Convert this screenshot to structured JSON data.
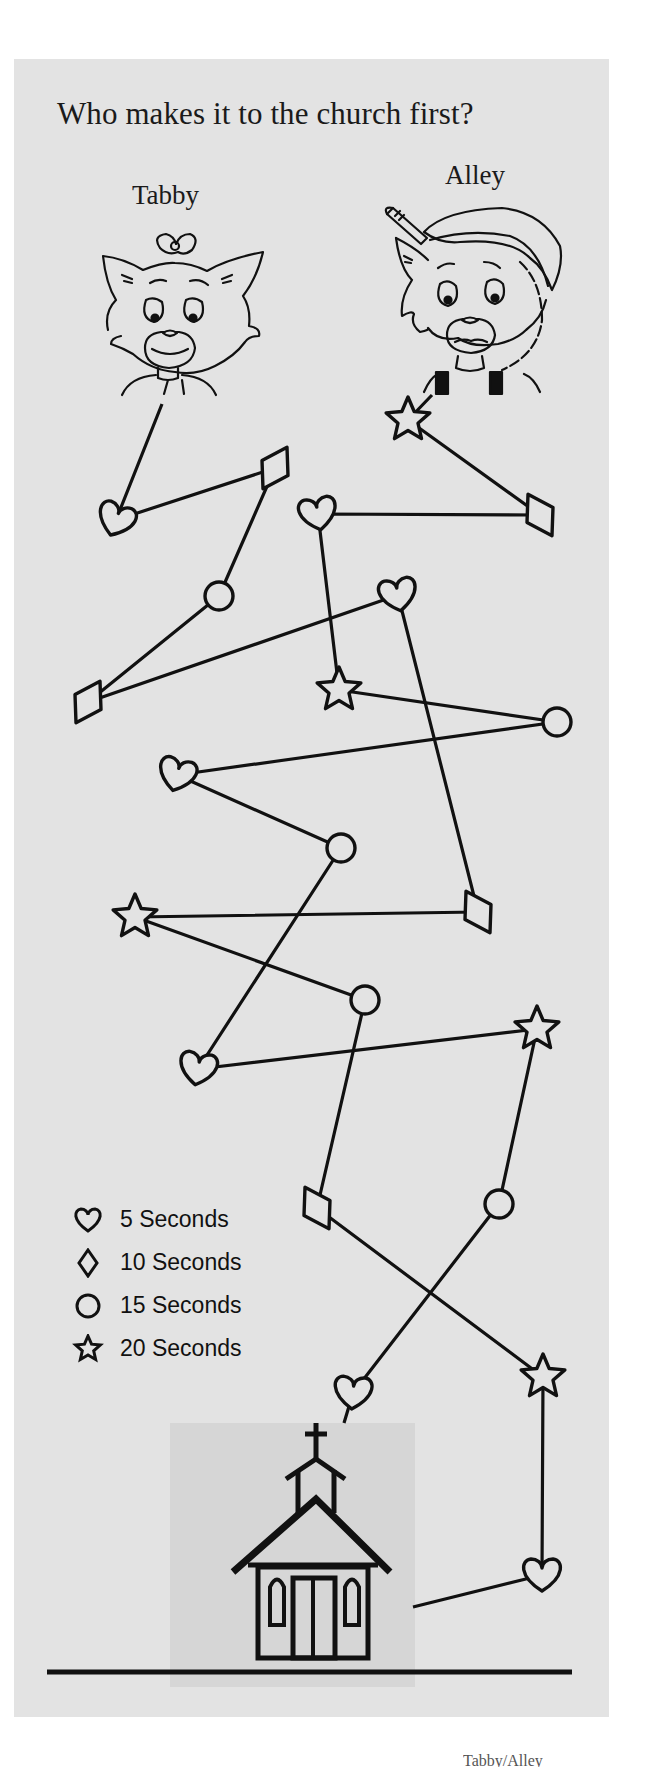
{
  "title": "Who makes it to the church first?",
  "characters": {
    "tabby": {
      "name": "Tabby"
    },
    "alley": {
      "name": "Alley"
    }
  },
  "legend": [
    {
      "shape": "heart",
      "icon": "heart-icon",
      "label": "5 Seconds",
      "seconds": 5
    },
    {
      "shape": "diamond",
      "icon": "diamond-icon",
      "label": "10 Seconds",
      "seconds": 10
    },
    {
      "shape": "circle",
      "icon": "circle-icon",
      "label": "15 Seconds",
      "seconds": 15
    },
    {
      "shape": "star",
      "icon": "star-icon",
      "label": "20 Seconds",
      "seconds": 20
    }
  ],
  "colors": {
    "panel": "#e3e3e3",
    "church_backdrop": "#d6d6d6",
    "ink": "#111111"
  },
  "paths": {
    "tabby": {
      "start": [
        162,
        404
      ],
      "nodes": [
        {
          "shape": "heart",
          "x": 116,
          "y": 520,
          "rot": 20
        },
        {
          "shape": "diamond",
          "x": 275,
          "y": 468,
          "rot": 30
        },
        {
          "shape": "circle",
          "x": 219,
          "y": 596
        },
        {
          "shape": "diamond",
          "x": 88,
          "y": 702,
          "rot": 30
        },
        {
          "shape": "heart",
          "x": 398,
          "y": 595,
          "rot": -10
        },
        {
          "shape": "diamond",
          "x": 478,
          "y": 912,
          "rot": -30
        },
        {
          "shape": "star",
          "x": 135,
          "y": 917
        },
        {
          "shape": "circle",
          "x": 365,
          "y": 1000
        },
        {
          "shape": "diamond",
          "x": 317,
          "y": 1208,
          "rot": -30
        },
        {
          "shape": "star",
          "x": 543,
          "y": 1377
        },
        {
          "shape": "heart",
          "x": 542,
          "y": 1575,
          "rot": 0
        }
      ],
      "end": [
        413,
        1607
      ]
    },
    "alley": {
      "start": [
        432,
        395
      ],
      "nodes": [
        {
          "shape": "star",
          "x": 408,
          "y": 420
        },
        {
          "shape": "diamond",
          "x": 540,
          "y": 515,
          "rot": -30
        },
        {
          "shape": "heart",
          "x": 318,
          "y": 514,
          "rot": -10
        },
        {
          "shape": "star",
          "x": 339,
          "y": 690
        },
        {
          "shape": "circle",
          "x": 557,
          "y": 722
        },
        {
          "shape": "heart",
          "x": 177,
          "y": 775,
          "rot": 15
        },
        {
          "shape": "circle",
          "x": 341,
          "y": 848
        },
        {
          "shape": "heart",
          "x": 198,
          "y": 1069,
          "rot": 10
        },
        {
          "shape": "star",
          "x": 537,
          "y": 1029
        },
        {
          "shape": "circle",
          "x": 499,
          "y": 1204
        },
        {
          "shape": "heart",
          "x": 353,
          "y": 1393,
          "rot": 5
        }
      ],
      "end": [
        344,
        1423
      ]
    }
  },
  "footer": {
    "text": "Tabby/Alley"
  }
}
